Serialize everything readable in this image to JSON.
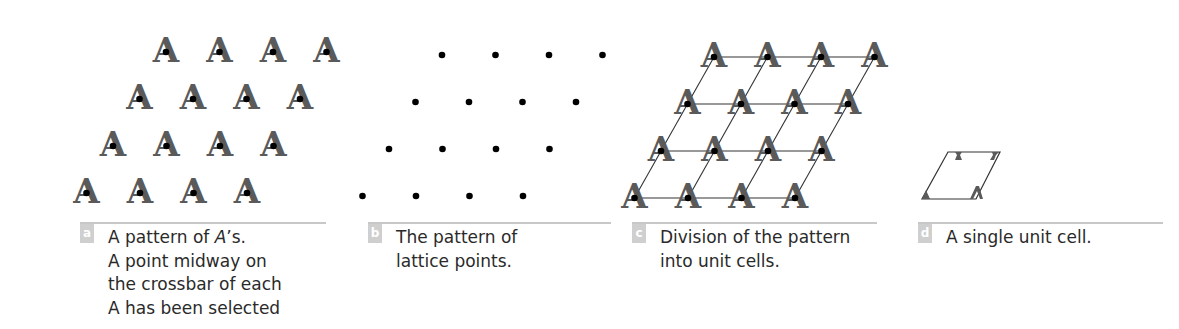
{
  "figure": {
    "glyph": "A",
    "glyph_color": "#5a5a5a",
    "dot_color": "#000000",
    "line_color": "#333333",
    "rule_color": "#c8c8c8",
    "badge_color": "#cfcfcf",
    "text_color": "#2a2a2a"
  },
  "panels": [
    {
      "id": "a",
      "badge": "a",
      "caption_lines": [
        "A pattern of A’s.",
        "A point midway on",
        "the crossbar of each",
        "A has been selected"
      ],
      "shows_glyphs": true,
      "shows_dots": true,
      "shows_grid": false
    },
    {
      "id": "b",
      "badge": "b",
      "caption_lines": [
        "The pattern of",
        "lattice points."
      ],
      "shows_glyphs": false,
      "shows_dots": true,
      "shows_grid": false
    },
    {
      "id": "c",
      "badge": "c",
      "caption_lines": [
        "Division of the pattern",
        "into unit cells."
      ],
      "shows_glyphs": true,
      "shows_dots": true,
      "shows_grid": true
    },
    {
      "id": "d",
      "badge": "d",
      "caption_lines": [
        "A single unit cell."
      ],
      "shows_glyphs": false,
      "shows_dots": false,
      "shows_grid": false
    }
  ],
  "lattice": {
    "rows": 4,
    "cols": 4,
    "dx": 53.5,
    "dy": 47,
    "row_shift": -26.5,
    "origins": {
      "a": [
        166,
        52
      ],
      "b": [
        442,
        55
      ],
      "c": [
        714,
        57
      ]
    }
  },
  "unit_cell": {
    "corners": [
      [
        948,
        152
      ],
      [
        1000,
        152
      ],
      [
        976,
        199
      ],
      [
        922,
        199
      ]
    ]
  }
}
